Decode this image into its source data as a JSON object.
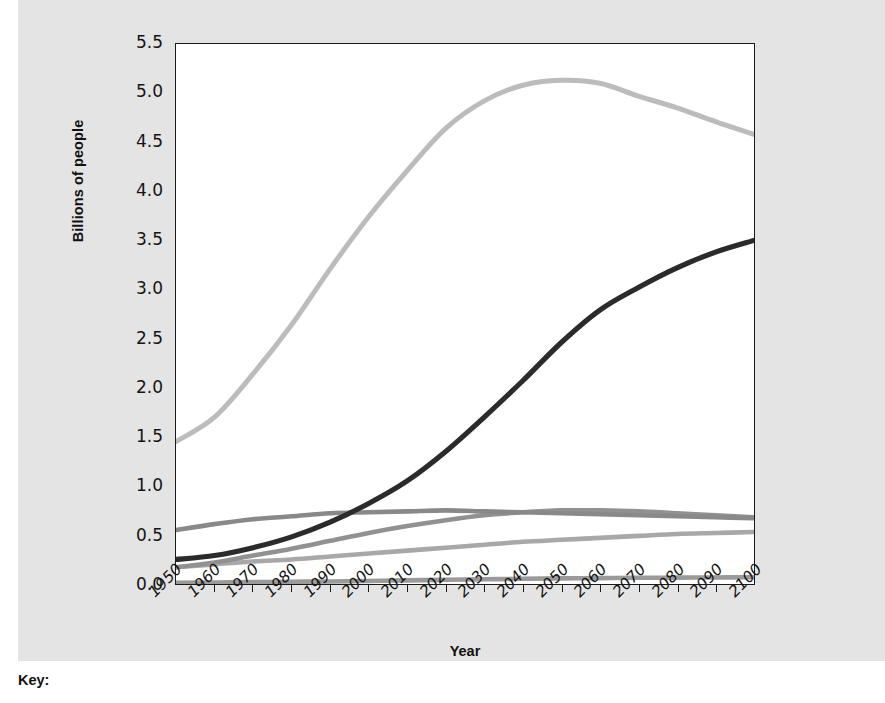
{
  "chart_data": {
    "type": "line",
    "title": "",
    "xlabel": "Year",
    "ylabel": "Billions of people",
    "xlim": [
      1950,
      2100
    ],
    "ylim": [
      0.0,
      5.5
    ],
    "grid": false,
    "legend_position": "below-chart",
    "x": [
      1950,
      1960,
      1970,
      1980,
      1990,
      2000,
      2010,
      2020,
      2030,
      2040,
      2050,
      2060,
      2070,
      2080,
      2090,
      2100
    ],
    "x_tick_labels": [
      "1950",
      "1960",
      "1970",
      "1980",
      "1990",
      "2000",
      "2010",
      "2020",
      "2030",
      "2040",
      "2050",
      "2060",
      "2070",
      "2080",
      "2090",
      "2100"
    ],
    "y_tick_labels": [
      "0.0",
      "0.5",
      "1.0",
      "1.5",
      "2.0",
      "2.5",
      "3.0",
      "3.5",
      "4.0",
      "4.5",
      "5.0",
      "5.5"
    ],
    "y_ticks": [
      0.0,
      0.5,
      1.0,
      1.5,
      2.0,
      2.5,
      3.0,
      3.5,
      4.0,
      4.5,
      5.0,
      5.5
    ],
    "series": [
      {
        "name": "asia",
        "color": "#bcbcbc",
        "width": 5.0,
        "values": [
          1.45,
          1.7,
          2.14,
          2.64,
          3.21,
          3.74,
          4.21,
          4.64,
          4.92,
          5.08,
          5.13,
          5.1,
          4.97,
          4.85,
          4.71,
          4.58
        ]
      },
      {
        "name": "africa",
        "color": "#2b2b2b",
        "width": 5.2,
        "values": [
          0.25,
          0.29,
          0.37,
          0.48,
          0.63,
          0.82,
          1.05,
          1.35,
          1.7,
          2.07,
          2.46,
          2.79,
          3.02,
          3.22,
          3.38,
          3.5
        ]
      },
      {
        "name": "europe",
        "color": "#898989",
        "width": 4.6,
        "values": [
          0.55,
          0.61,
          0.66,
          0.69,
          0.72,
          0.73,
          0.74,
          0.75,
          0.74,
          0.73,
          0.72,
          0.71,
          0.7,
          0.69,
          0.68,
          0.67
        ]
      },
      {
        "name": "latin-america",
        "color": "#919191",
        "width": 4.6,
        "values": [
          0.17,
          0.22,
          0.29,
          0.36,
          0.44,
          0.52,
          0.59,
          0.65,
          0.7,
          0.73,
          0.75,
          0.75,
          0.74,
          0.72,
          0.7,
          0.68
        ]
      },
      {
        "name": "north-america",
        "color": "#a8a8a8",
        "width": 4.6,
        "values": [
          0.17,
          0.2,
          0.23,
          0.25,
          0.28,
          0.31,
          0.34,
          0.37,
          0.4,
          0.43,
          0.45,
          0.47,
          0.49,
          0.51,
          0.52,
          0.53
        ]
      },
      {
        "name": "oceania",
        "color": "#9a9a9a",
        "width": 4.6,
        "values": [
          0.013,
          0.016,
          0.019,
          0.023,
          0.026,
          0.031,
          0.037,
          0.043,
          0.048,
          0.053,
          0.057,
          0.06,
          0.063,
          0.065,
          0.067,
          0.069
        ]
      }
    ]
  },
  "axes": {
    "y_title": "Billions of people",
    "x_title": "Year",
    "y_tick_labels": [
      "5.5",
      "5.0",
      "4.5",
      "4.0",
      "3.5",
      "3.0",
      "2.5",
      "2.0",
      "1.5",
      "1.0",
      "0.5",
      "0.0"
    ],
    "x_tick_labels": [
      "1950",
      "1960",
      "1970",
      "1980",
      "1990",
      "2000",
      "2010",
      "2020",
      "2030",
      "2040",
      "2050",
      "2060",
      "2070",
      "2080",
      "2090",
      "2100"
    ]
  },
  "key": {
    "title": "Key:",
    "items": []
  },
  "colors": {
    "panel_background": "#e4e4e4",
    "plot_background": "#ffffff",
    "axis": "#1b1b1b",
    "text": "#111111"
  }
}
